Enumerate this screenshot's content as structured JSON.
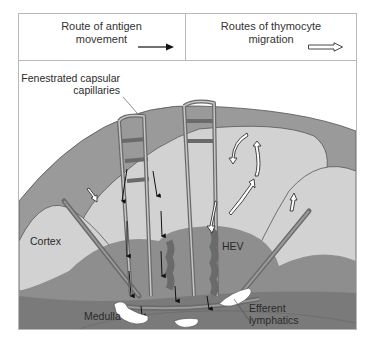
{
  "legend": {
    "antigen": {
      "label_line1": "Route of antigen",
      "label_line2": "movement",
      "arrow": "solid-black-arrow"
    },
    "thymocyte": {
      "label_line1": "Routes of thymocyte",
      "label_line2": "migration",
      "arrow": "hollow-white-arrow"
    }
  },
  "labels": {
    "capillaries_line1": "Fenestrated capsular",
    "capillaries_line2": "capillaries",
    "cortex": "Cortex",
    "hev": "HEV",
    "medulla": "Medulla",
    "efferent_line1": "Efferent",
    "efferent_line2": "lymphatics"
  },
  "colors": {
    "background": "#ffffff",
    "border": "#b8b8b8",
    "capsule": "#9a9a9a",
    "cortex": "#d2d2d2",
    "paracortex": "#8e8e8e",
    "medulla": "#7a7a7a",
    "vessel": "#6a6a6a",
    "lymphatic": "#ffffff"
  }
}
